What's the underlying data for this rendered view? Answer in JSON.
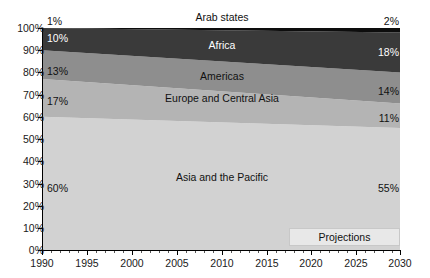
{
  "chart_data": {
    "type": "area",
    "stacked": true,
    "normalized": true,
    "title": "",
    "subtitle": "",
    "xlabel": "",
    "ylabel": "",
    "xlim": [
      1990,
      2030
    ],
    "ylim": [
      0,
      100
    ],
    "grid": false,
    "legend_position": "inline-labels",
    "x": [
      1990,
      2030
    ],
    "x_tick_labels": [
      "1990",
      "1995",
      "2000",
      "2005",
      "2010",
      "2015",
      "2020",
      "2025",
      "2030"
    ],
    "x_tick_values": [
      1990,
      1995,
      2000,
      2005,
      2010,
      2015,
      2020,
      2025,
      2030
    ],
    "y_tick_labels": [
      "0%",
      "10%",
      "20%",
      "30%",
      "40%",
      "50%",
      "60%",
      "70%",
      "80%",
      "90%",
      "100%"
    ],
    "y_tick_values": [
      0,
      10,
      20,
      30,
      40,
      50,
      60,
      70,
      80,
      90,
      100
    ],
    "series": [
      {
        "name": "Asia and the Pacific",
        "values": [
          60,
          55
        ],
        "start_label": "60%",
        "end_label": "55%",
        "color": "#d2d2d2",
        "label_color": "dark"
      },
      {
        "name": "Europe and Central Asia",
        "values": [
          17,
          11
        ],
        "start_label": "17%",
        "end_label": "11%",
        "color": "#b4b4b4",
        "label_color": "dark"
      },
      {
        "name": "Americas",
        "values": [
          13,
          14
        ],
        "start_label": "13%",
        "end_label": "14%",
        "color": "#8e8e8e",
        "label_color": "dark"
      },
      {
        "name": "Africa",
        "values": [
          10,
          18
        ],
        "start_label": "10%",
        "end_label": "18%",
        "color": "#3a3a3a",
        "label_color": "light"
      },
      {
        "name": "Arab states",
        "values": [
          1,
          2
        ],
        "start_label": "1%",
        "end_label": "2%",
        "color": "#0d0d0d",
        "label_color": "dark"
      }
    ],
    "annotations": [
      {
        "text": "Projections",
        "from_x": 2017,
        "to_x": 2030
      }
    ]
  },
  "labels": {
    "arab_states": "Arab states",
    "africa": "Africa",
    "americas": "Americas",
    "europe_central_asia": "Europe and Central Asia",
    "asia_pacific": "Asia and the Pacific",
    "projections": "Projections"
  },
  "values": {
    "arab_start": "1%",
    "arab_end": "2%",
    "africa_start": "10%",
    "africa_end": "18%",
    "americas_start": "13%",
    "americas_end": "14%",
    "europe_start": "17%",
    "europe_end": "14%",
    "europe_end_actual": "11%",
    "asia_start": "60%",
    "asia_end": "55%"
  },
  "y_axis": {
    "t100": "100%",
    "t90": "90%",
    "t80": "80%",
    "t70": "70%",
    "t60": "60%",
    "t50": "50%",
    "t40": "40%",
    "t30": "30%",
    "t20": "20%",
    "t10": "10%",
    "t0": "0%"
  },
  "x_axis": {
    "t1990": "1990",
    "t1995": "1995",
    "t2000": "2000",
    "t2005": "2005",
    "t2010": "2010",
    "t2015": "2015",
    "t2020": "2020",
    "t2025": "2025",
    "t2030": "2030"
  }
}
